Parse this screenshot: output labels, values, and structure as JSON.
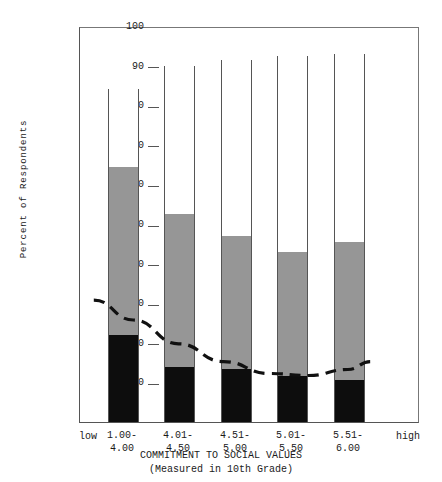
{
  "chart_data": {
    "type": "bar",
    "stacked": true,
    "title": "",
    "xlabel": "COMMITMENT TO SOCIAL VALUES",
    "xlabel_sub": "(Measured in 10th Grade)",
    "ylabel": "Percent of Respondents",
    "ylim": [
      0,
      100
    ],
    "yticks": [
      100,
      90,
      80,
      70,
      60,
      50,
      40,
      30,
      20,
      10
    ],
    "grid": false,
    "legend": "none",
    "axis_end_labels": {
      "left": "low",
      "right": "high"
    },
    "categories": [
      "1.00-\n4.00",
      "4.01-\n4.50",
      "4.51-\n5.00",
      "5.01-\n5.50",
      "5.51-\n6.00"
    ],
    "category_lines": [
      [
        "1.00-",
        "4.00"
      ],
      [
        "4.01-",
        "4.50"
      ],
      [
        "4.51-",
        "5.00"
      ],
      [
        "5.01-",
        "5.50"
      ],
      [
        "5.51-",
        "6.00"
      ]
    ],
    "series": [
      {
        "name": "bottom-segment",
        "color": "#0d0d0d",
        "values": [
          22,
          14,
          13.5,
          11.5,
          10.5
        ]
      },
      {
        "name": "middle-segment",
        "color": "#969696",
        "values": [
          42.5,
          38.5,
          33.5,
          31.5,
          35
        ]
      },
      {
        "name": "top-segment",
        "color": "#ffffff",
        "values": [
          19.5,
          37.5,
          44.5,
          49.5,
          47.5
        ]
      }
    ],
    "cumulative_tops": [
      [
        22,
        64.5,
        84
      ],
      [
        14,
        52.5,
        90
      ],
      [
        13.5,
        47,
        91.5
      ],
      [
        11.5,
        43,
        92.5
      ],
      [
        10.5,
        45.5,
        93
      ]
    ],
    "bar_totals": [
      84,
      90,
      91.5,
      92.5,
      93
    ],
    "trend_curve": {
      "style": "dashed",
      "color": "#111111",
      "points": [
        {
          "x": 0.5,
          "y": 31
        },
        {
          "x": 1.2,
          "y": 26
        },
        {
          "x": 2.0,
          "y": 20
        },
        {
          "x": 2.8,
          "y": 15.5
        },
        {
          "x": 3.6,
          "y": 12.5
        },
        {
          "x": 4.3,
          "y": 12
        },
        {
          "x": 5.0,
          "y": 13.5
        },
        {
          "x": 5.4,
          "y": 15.5
        }
      ]
    }
  }
}
